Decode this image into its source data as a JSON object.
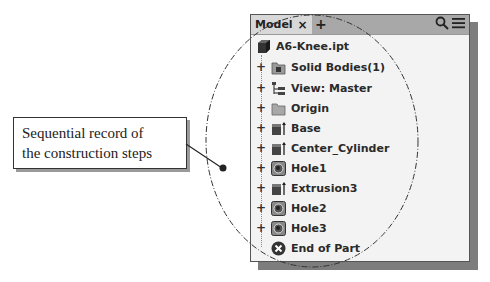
{
  "callout": {
    "line1": "Sequential record of",
    "line2": "the construction steps"
  },
  "panel": {
    "tab_label": "Model",
    "tab_close": "×",
    "add_tab": "+",
    "search_icon": "search-icon",
    "menu_icon": "menu-icon"
  },
  "tree": {
    "root": {
      "label": "A6-Knee.ipt",
      "icon": "part-icon"
    },
    "items": [
      {
        "label": "Solid Bodies(1)",
        "icon": "solid-bodies-folder-icon",
        "expander": "+"
      },
      {
        "label": "View: Master",
        "icon": "view-icon",
        "expander": "+"
      },
      {
        "label": "Origin",
        "icon": "folder-icon",
        "expander": "+"
      },
      {
        "label": "Base",
        "icon": "extrusion-icon",
        "expander": "+"
      },
      {
        "label": "Center_Cylinder",
        "icon": "extrusion-icon",
        "expander": "+"
      },
      {
        "label": "Hole1",
        "icon": "hole-icon",
        "expander": "+"
      },
      {
        "label": "Extrusion3",
        "icon": "extrusion-icon",
        "expander": "+"
      },
      {
        "label": "Hole2",
        "icon": "hole-icon",
        "expander": "+"
      },
      {
        "label": "Hole3",
        "icon": "hole-icon",
        "expander": "+"
      }
    ],
    "end": {
      "label": "End of Part",
      "icon": "end-of-part-icon"
    }
  }
}
